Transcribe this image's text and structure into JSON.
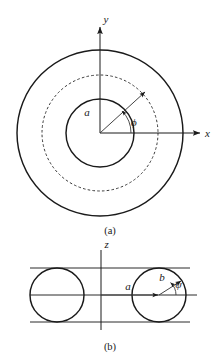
{
  "figure": {
    "background_color": "#ffffff",
    "ink_color": "#1a1a1a",
    "panels": [
      {
        "id": "panel-a",
        "caption": "(a)",
        "view": "cross-section perpendicular to the torus axis",
        "axes": [
          {
            "name": "y-axis",
            "label": "y",
            "direction": "up"
          },
          {
            "name": "x-axis",
            "label": "x",
            "direction": "right"
          }
        ],
        "circles": [
          {
            "name": "outer-circle",
            "style": "solid",
            "center_x": 100,
            "center_y": 133,
            "radius": 83
          },
          {
            "name": "mean-circle",
            "style": "dashed",
            "center_x": 100,
            "center_y": 133,
            "radius": 58
          },
          {
            "name": "inner-circle",
            "style": "solid",
            "center_x": 100,
            "center_y": 133,
            "radius": 34
          }
        ],
        "vectors": [
          {
            "name": "radius-a-vector",
            "label": "a",
            "from_x": 100,
            "from_y": 133,
            "to_x": 146,
            "to_y": 92
          }
        ],
        "angles": [
          {
            "name": "phi-angle",
            "label": "ϕ",
            "from_axis": "x-axis",
            "to": "radius-a-vector",
            "sense": "counterclockwise"
          }
        ]
      },
      {
        "id": "panel-b",
        "caption": "(b)",
        "view": "meridional section containing the torus axis",
        "axes": [
          {
            "name": "z-axis",
            "label": "z",
            "direction": "up"
          },
          {
            "name": "radial-axis",
            "label": "",
            "direction": "right"
          }
        ],
        "circles": [
          {
            "name": "left-tube-circle",
            "style": "solid",
            "center_x": 57,
            "center_y": 295,
            "radius": 27
          },
          {
            "name": "right-tube-circle",
            "style": "solid",
            "center_x": 159,
            "center_y": 295,
            "radius": 27
          }
        ],
        "vectors": [
          {
            "name": "distance-a-vector",
            "label": "a",
            "from_x": 101,
            "from_y": 295,
            "to_x": 159,
            "to_y": 295
          },
          {
            "name": "radius-b-vector",
            "label": "b",
            "from_x": 159,
            "from_y": 295,
            "to_x": 182,
            "to_y": 281
          }
        ],
        "angles": [
          {
            "name": "psi-angle",
            "label": "ψ",
            "from_axis": "radial-axis",
            "to": "radius-b-vector",
            "sense": "counterclockwise"
          }
        ],
        "tangent_lines": [
          {
            "name": "upper-tangent-line",
            "y": 268
          },
          {
            "name": "lower-tangent-line",
            "y": 322
          }
        ]
      }
    ],
    "labels": {
      "y_axis": "y",
      "x_axis": "x",
      "z_axis": "z",
      "major_radius_a": "a",
      "minor_radius_b": "b",
      "azimuth_phi": "ϕ",
      "poloidal_psi": "ψ",
      "caption_a": "(a)",
      "caption_b": "(b)"
    }
  }
}
